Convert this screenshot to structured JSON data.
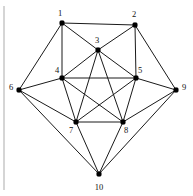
{
  "figure": {
    "background_color": "#ffffff",
    "edge_color": "#1a1a1a",
    "node_color": "#000000",
    "label_color": "#111111",
    "margin_rule_color": "#b9b9b9",
    "width": 193,
    "height": 196
  },
  "margin_rule": {
    "name": "left-margin-line",
    "x1": 4,
    "y1": 6,
    "x2": 4,
    "y2": 190
  },
  "chart_data": {
    "type": "diagram",
    "graph_type": "undirected",
    "node_count": 10,
    "edge_count": 25,
    "nodes": [
      {
        "id": 1,
        "label": "1",
        "x": 62,
        "y": 23,
        "label_x": 60,
        "label_y": 14,
        "degree": 4
      },
      {
        "id": 2,
        "label": "2",
        "x": 135,
        "y": 25,
        "label_x": 134,
        "label_y": 15,
        "degree": 4
      },
      {
        "id": 3,
        "label": "3",
        "x": 98,
        "y": 50,
        "label_x": 97,
        "label_y": 41,
        "degree": 6
      },
      {
        "id": 4,
        "label": "4",
        "x": 62,
        "y": 78,
        "label_x": 57,
        "label_y": 71,
        "degree": 6
      },
      {
        "id": 5,
        "label": "5",
        "x": 136,
        "y": 78,
        "label_x": 140,
        "label_y": 71,
        "degree": 6
      },
      {
        "id": 6,
        "label": "6",
        "x": 19,
        "y": 90,
        "label_x": 11,
        "label_y": 88,
        "degree": 4
      },
      {
        "id": 7,
        "label": "7",
        "x": 76,
        "y": 122,
        "label_x": 71,
        "label_y": 131,
        "degree": 6
      },
      {
        "id": 8,
        "label": "8",
        "x": 123,
        "y": 122,
        "label_x": 126,
        "label_y": 131,
        "degree": 6
      },
      {
        "id": 9,
        "label": "9",
        "x": 176,
        "y": 90,
        "label_x": 184,
        "label_y": 88,
        "degree": 4
      },
      {
        "id": 10,
        "label": "10",
        "x": 99,
        "y": 174,
        "label_x": 99,
        "label_y": 188,
        "degree": 4
      }
    ],
    "edges": [
      {
        "source": 1,
        "target": 2
      },
      {
        "source": 1,
        "target": 3
      },
      {
        "source": 1,
        "target": 4
      },
      {
        "source": 1,
        "target": 6
      },
      {
        "source": 2,
        "target": 3
      },
      {
        "source": 2,
        "target": 5
      },
      {
        "source": 2,
        "target": 9
      },
      {
        "source": 3,
        "target": 4
      },
      {
        "source": 3,
        "target": 5
      },
      {
        "source": 3,
        "target": 7
      },
      {
        "source": 3,
        "target": 8
      },
      {
        "source": 4,
        "target": 5
      },
      {
        "source": 4,
        "target": 6
      },
      {
        "source": 4,
        "target": 7
      },
      {
        "source": 4,
        "target": 8
      },
      {
        "source": 5,
        "target": 7
      },
      {
        "source": 5,
        "target": 8
      },
      {
        "source": 5,
        "target": 9
      },
      {
        "source": 6,
        "target": 7
      },
      {
        "source": 6,
        "target": 10
      },
      {
        "source": 7,
        "target": 8
      },
      {
        "source": 7,
        "target": 10
      },
      {
        "source": 8,
        "target": 9
      },
      {
        "source": 8,
        "target": 10
      },
      {
        "source": 9,
        "target": 10
      }
    ]
  }
}
